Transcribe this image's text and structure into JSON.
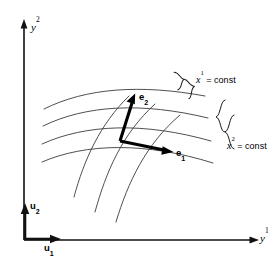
{
  "figure": {
    "background_color": "#ffffff",
    "axes": {
      "vertical": {
        "name": "y-superscript-2-axis",
        "label_base": "y",
        "label_sup": "2",
        "arrow_direction": "up"
      },
      "horizontal": {
        "name": "y-superscript-1-axis",
        "label_base": "y",
        "label_sup": "1",
        "arrow_direction": "right"
      }
    },
    "basis_vectors": [
      {
        "name": "u1",
        "label_base": "u",
        "label_sub": "1",
        "direction": "right",
        "description": "Cartesian unit basis vector along y1"
      },
      {
        "name": "u2",
        "label_base": "u",
        "label_sub": "2",
        "direction": "up",
        "description": "Cartesian unit basis vector along y2"
      }
    ],
    "tangent_vectors": [
      {
        "name": "e1",
        "label_base": "e",
        "label_sub": "1",
        "direction": "right-down",
        "description": "Tangent basis vector along the x2 = const curve"
      },
      {
        "name": "e2",
        "label_base": "e",
        "label_sub": "2",
        "direction": "up-right",
        "description": "Tangent basis vector along the x1 = const curve"
      }
    ],
    "curve_families": [
      {
        "name": "x1-const-family",
        "label_var": "x",
        "label_sup": "1",
        "label_eq": " = const",
        "curve_count": 3,
        "brace_side": "upper-right",
        "orientation": "steep"
      },
      {
        "name": "x2-const-family",
        "label_var": "x",
        "label_sup": "2",
        "label_eq": " = const",
        "curve_count": 3,
        "brace_side": "right",
        "orientation": "shallow"
      }
    ],
    "colors": {
      "axis": "#111111",
      "curve": "#3b3b3b",
      "vector": "#000000",
      "brace": "#1a1a1a",
      "text": "#000000"
    }
  }
}
